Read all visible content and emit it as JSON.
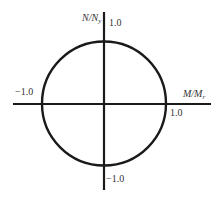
{
  "diagram": {
    "y_axis": {
      "label_main": "N/N",
      "label_sub": "y",
      "top_value": "1.0",
      "bottom_value": "−1.0"
    },
    "x_axis": {
      "label_main": "M/M",
      "label_sub": "r",
      "right_value": "1.0",
      "left_value": "−1.0"
    },
    "shape": "circle",
    "colors": {
      "line": "#1a1a1a",
      "text": "#333333",
      "background": "#ffffff"
    }
  }
}
